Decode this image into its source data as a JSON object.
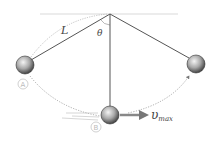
{
  "diagram": {
    "type": "pendulum",
    "labels": {
      "length": "L",
      "angle": "θ",
      "point_a": "A",
      "point_b": "B",
      "velocity_main": "υ",
      "velocity_sub": "max"
    },
    "colors": {
      "string": "#555555",
      "ceiling": "#e6e6e6",
      "arc": "#999999",
      "arrow": "#777777",
      "circled_label": "#bbbbbb"
    }
  }
}
